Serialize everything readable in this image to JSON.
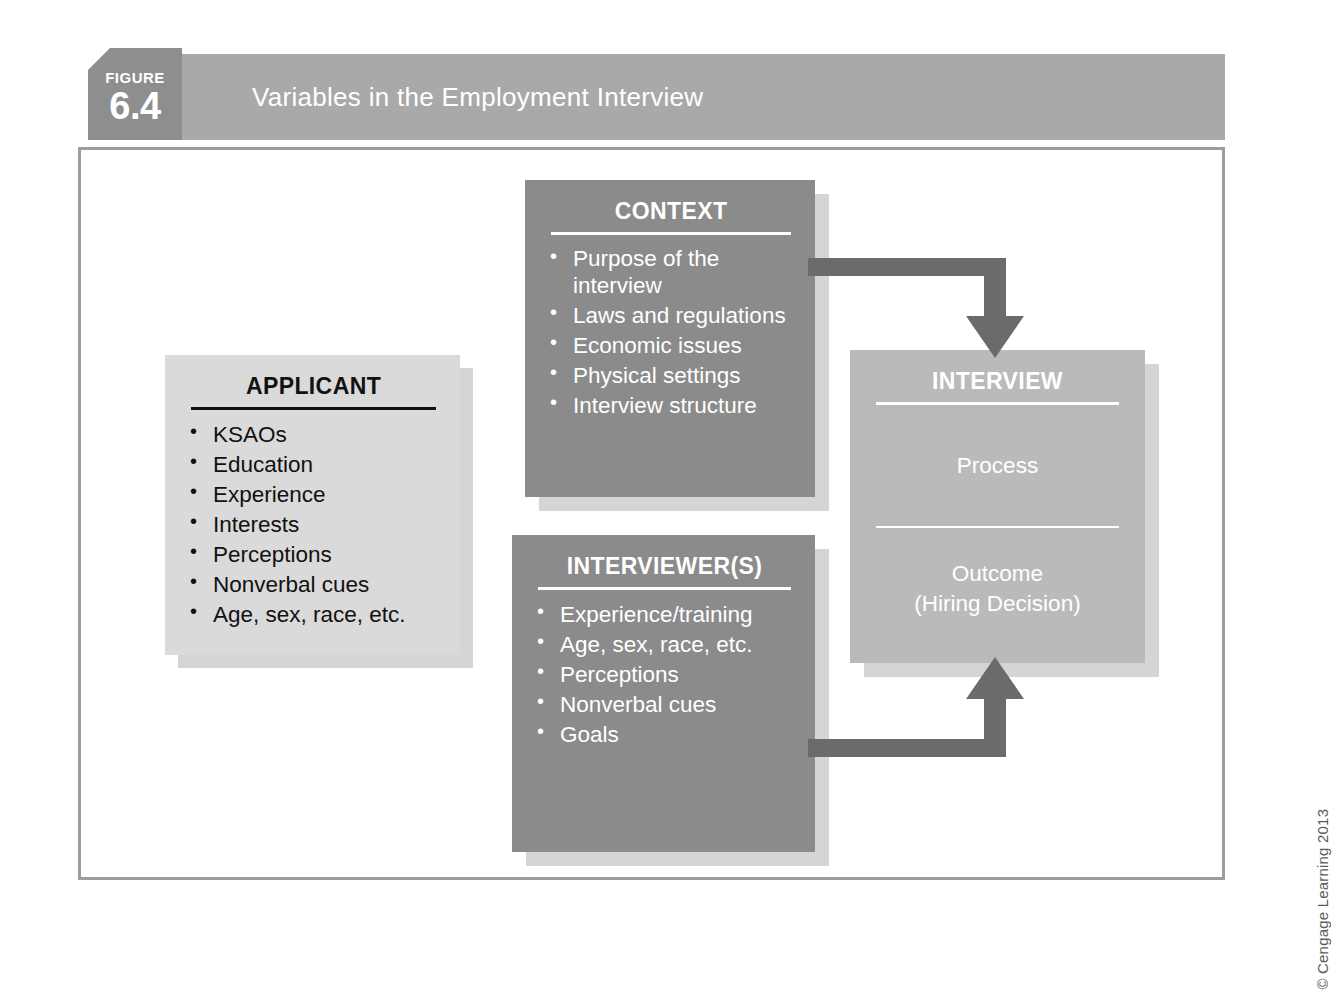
{
  "figure": {
    "tag_label": "FIGURE",
    "tag_number": "6.4",
    "title": "Variables in the Employment Interview",
    "copyright": "© Cengage Learning 2013"
  },
  "colors": {
    "banner": "#a9a9a9",
    "tag": "#8e8e8e",
    "box_dark": "#8b8b8b",
    "box_mid": "#bababa",
    "box_light": "#dadada",
    "arrow": "#6b6b6b",
    "shadow": "#d5d5d5",
    "frame_border": "#9d9d9d"
  },
  "boxes": {
    "applicant": {
      "title": "APPLICANT",
      "items": [
        "KSAOs",
        "Education",
        "Experience",
        "Interests",
        "Perceptions",
        "Nonverbal cues",
        "Age, sex, race, etc."
      ]
    },
    "context": {
      "title": "CONTEXT",
      "items": [
        "Purpose of the interview",
        "Laws and regulations",
        "Economic issues",
        "Physical settings",
        "Interview structure"
      ]
    },
    "interviewers": {
      "title": "INTERVIEWER(S)",
      "items": [
        "Experience/training",
        "Age, sex, race, etc.",
        "Perceptions",
        "Nonverbal cues",
        "Goals"
      ]
    },
    "interview": {
      "title": "INTERVIEW",
      "process_label": "Process",
      "outcome_line1": "Outcome",
      "outcome_line2": "(Hiring Decision)"
    }
  },
  "arrows": [
    {
      "name": "context-to-interview",
      "from": "CONTEXT",
      "to": "INTERVIEW",
      "direction": "right-then-down"
    },
    {
      "name": "interviewers-to-interview",
      "from": "INTERVIEWER(S)",
      "to": "INTERVIEW",
      "direction": "right-then-up"
    }
  ]
}
